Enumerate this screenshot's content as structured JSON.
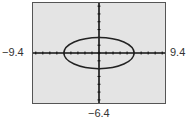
{
  "chart_data": {
    "type": "line",
    "title": "",
    "equation": "x^2/25 + y^2/4 = 1",
    "xlim": [
      -9.4,
      9.4
    ],
    "ylim": [
      -6.4,
      6.4
    ],
    "xscl": 1,
    "yscl": 1,
    "grid": false,
    "series": [
      {
        "name": "ellipse",
        "center": [
          0,
          0
        ],
        "semi_major_x": 5,
        "semi_minor_y": 2
      }
    ],
    "labels": {
      "xmin": "−9.4",
      "xmax": "9.4",
      "ymin": "−6.4"
    }
  },
  "colors": {
    "screen_bg": "#e4e4e4",
    "curve": "#222222",
    "axes": "#111111"
  }
}
